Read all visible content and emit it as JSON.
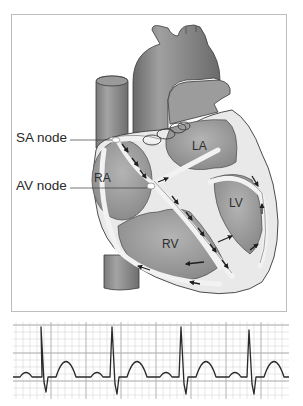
{
  "diagram": {
    "labels": {
      "sa_node": "SA node",
      "av_node": "AV node"
    },
    "chambers": {
      "ra": "RA",
      "la": "LA",
      "lv": "LV",
      "rv": "RV"
    },
    "colors": {
      "frame_border": "#bdbdbd",
      "heart_dark": "#6f6f6f",
      "heart_mid": "#8c8c8c",
      "heart_light": "#a8a8a8",
      "conduction_path": "#ececec",
      "arrows": "#1e1e1e",
      "ecg_grid_minor": "#d4d4d4",
      "ecg_grid_major": "#b0b0b0",
      "ecg_trace": "#2a2a2a"
    }
  },
  "ecg": {
    "beats": 4,
    "components_per_beat": [
      "P wave",
      "QRS complex",
      "T wave"
    ],
    "rhythm": "regular"
  }
}
